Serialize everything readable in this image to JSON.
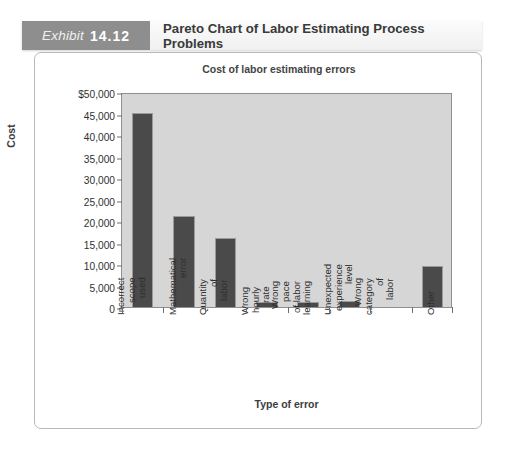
{
  "exhibit": {
    "label": "Exhibit",
    "number": "14.12",
    "title": "Pareto Chart of Labor Estimating Process Problems"
  },
  "chart_data": {
    "type": "bar",
    "title": "Cost of labor estimating errors",
    "xlabel": "Type of error",
    "ylabel": "Cost",
    "ylim": [
      0,
      50000
    ],
    "grid": false,
    "legend": "none",
    "categories": [
      "Incorrect\nscope used",
      "Mathematical\nerror",
      "Quantity of\nlabor",
      "Wrong hourly\nrate",
      "Wrong pace\nof labor learning",
      "Unexpected\nexperience\nlevel",
      "Wrong\ncategory of\nlabor",
      "Other"
    ],
    "values": [
      45200,
      21200,
      16000,
      1200,
      1200,
      1300,
      0,
      9500
    ],
    "ytick_labels": [
      "$50,000",
      "45,000",
      "40,000",
      "35,000",
      "30,000",
      "25,000",
      "20,000",
      "15,000",
      "10,000",
      "5,000",
      "0"
    ],
    "ytick_values": [
      50000,
      45000,
      40000,
      35000,
      30000,
      25000,
      20000,
      15000,
      10000,
      5000,
      0
    ],
    "bar_color": "#4a4a4a",
    "plot_background": "#d6d6d6"
  }
}
